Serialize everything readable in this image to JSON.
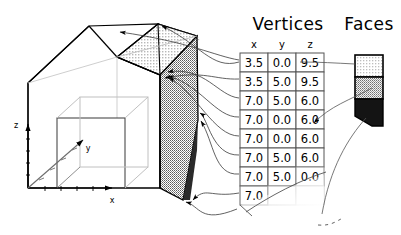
{
  "figure": {
    "title_vertices": "Vertices",
    "title_faces": "Faces",
    "background_color": "#ffffff",
    "line_color": "#000000"
  },
  "axes": {
    "x_label": "x",
    "y_label": "y",
    "z_label": "z"
  },
  "vertices_table": {
    "header": "Vertices",
    "columns": [
      "x",
      "y",
      "z"
    ],
    "rows": [
      {
        "x": "3.5",
        "y": "0.0",
        "z": "9.5"
      },
      {
        "x": "3.5",
        "y": "5.0",
        "z": "9.5"
      },
      {
        "x": "7.0",
        "y": "5.0",
        "z": "6.0"
      },
      {
        "x": "7.0",
        "y": "0.0",
        "z": "6.0"
      },
      {
        "x": "7.0",
        "y": "0.0",
        "z": "6.0"
      },
      {
        "x": "7.0",
        "y": "5.0",
        "z": "6.0"
      },
      {
        "x": "7.0",
        "y": "5.0",
        "z": "0.0"
      },
      {
        "x": "7.0",
        "y": "",
        "z": ""
      }
    ]
  },
  "faces_strip": {
    "header": "Faces",
    "cells": [
      {
        "shade": "light",
        "color": "#d9d9d9"
      },
      {
        "shade": "medium",
        "color": "#9a9a9a"
      },
      {
        "shade": "dark",
        "color": "#1a1a1a"
      }
    ]
  },
  "model": {
    "name": "house-prism",
    "roof_shade_color": "#cfcfcf",
    "wall_shade_color": "#8f8f8f",
    "edge_color": "#000000",
    "inner_cube_color": "#9a9a9a"
  }
}
